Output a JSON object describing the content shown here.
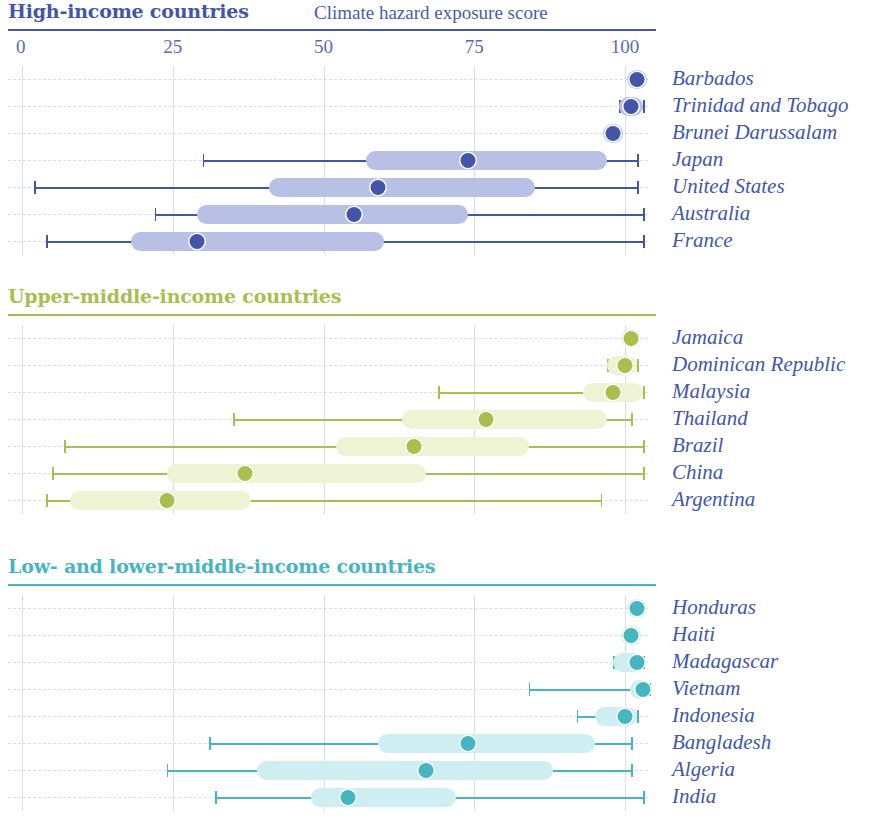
{
  "axis_title": "Climate hazard exposure score",
  "axis": {
    "ticks": [
      "0",
      "25",
      "50",
      "75",
      "100"
    ],
    "min": 0,
    "max": 100
  },
  "panels": [
    {
      "title": "High-income countries",
      "color": "#4355a8",
      "box_color": "#b9c0e6",
      "rows": [
        {
          "label": "Barbados"
        },
        {
          "label": "Trinidad and Tobago"
        },
        {
          "label": "Brunei Darussalam"
        },
        {
          "label": "Japan"
        },
        {
          "label": "United States"
        },
        {
          "label": "Australia"
        },
        {
          "label": "France"
        }
      ]
    },
    {
      "title": "Upper-middle-income countries",
      "color": "#a8bf4e",
      "box_color": "#eef3d4",
      "rows": [
        {
          "label": "Jamaica"
        },
        {
          "label": "Dominican Republic"
        },
        {
          "label": "Malaysia"
        },
        {
          "label": "Thailand"
        },
        {
          "label": "Brazil"
        },
        {
          "label": "China"
        },
        {
          "label": "Argentina"
        }
      ]
    },
    {
      "title": "Low- and lower-middle-income countries",
      "color": "#45b6c0",
      "box_color": "#cfeef2",
      "rows": [
        {
          "label": "Honduras"
        },
        {
          "label": "Haiti"
        },
        {
          "label": "Madagascar"
        },
        {
          "label": "Vietnam"
        },
        {
          "label": "Indonesia"
        },
        {
          "label": "Bangladesh"
        },
        {
          "label": "Algeria"
        },
        {
          "label": "India"
        }
      ]
    }
  ],
  "chart_data": {
    "type": "boxplot",
    "title": "Climate hazard exposure score",
    "xlabel": "Climate hazard exposure score",
    "ylabel": "",
    "xlim": [
      0,
      100
    ],
    "xticks": [
      0,
      25,
      50,
      75,
      100
    ],
    "grid": true,
    "legend": "none",
    "orientation": "horizontal",
    "groups": [
      {
        "name": "High-income countries",
        "color": "#4355a8",
        "box_color": "#b9c0e6",
        "items": [
          {
            "label": "Barbados",
            "min": 102,
            "q1": 102,
            "median": 102,
            "q3": 102,
            "max": 102
          },
          {
            "label": "Trinidad and Tobago",
            "min": 99,
            "q1": 99,
            "median": 101,
            "q3": 103,
            "max": 103
          },
          {
            "label": "Brunei Darussalam",
            "min": 98,
            "q1": 98,
            "median": 98,
            "q3": 98,
            "max": 98
          },
          {
            "label": "Japan",
            "min": 30,
            "q1": 57,
            "median": 74,
            "q3": 97,
            "max": 102
          },
          {
            "label": "United States",
            "min": 2,
            "q1": 41,
            "median": 59,
            "q3": 85,
            "max": 102
          },
          {
            "label": "Australia",
            "min": 22,
            "q1": 29,
            "median": 55,
            "q3": 74,
            "max": 103
          },
          {
            "label": "France",
            "min": 4,
            "q1": 18,
            "median": 29,
            "q3": 60,
            "max": 103
          }
        ]
      },
      {
        "name": "Upper-middle-income countries",
        "color": "#a8bf4e",
        "box_color": "#eef3d4",
        "items": [
          {
            "label": "Jamaica",
            "min": 101,
            "q1": 101,
            "median": 101,
            "q3": 101,
            "max": 101
          },
          {
            "label": "Dominican Republic",
            "min": 97,
            "q1": 97,
            "median": 100,
            "q3": 102,
            "max": 102
          },
          {
            "label": "Malaysia",
            "min": 69,
            "q1": 93,
            "median": 98,
            "q3": 103,
            "max": 103
          },
          {
            "label": "Thailand",
            "min": 35,
            "q1": 63,
            "median": 77,
            "q3": 97,
            "max": 101
          },
          {
            "label": "Brazil",
            "min": 7,
            "q1": 52,
            "median": 65,
            "q3": 84,
            "max": 103
          },
          {
            "label": "China",
            "min": 5,
            "q1": 24,
            "median": 37,
            "q3": 67,
            "max": 103
          },
          {
            "label": "Argentina",
            "min": 4,
            "q1": 8,
            "median": 24,
            "q3": 38,
            "max": 96
          }
        ]
      },
      {
        "name": "Low- and lower-middle-income countries",
        "color": "#45b6c0",
        "box_color": "#cfeef2",
        "items": [
          {
            "label": "Honduras",
            "min": 102,
            "q1": 102,
            "median": 102,
            "q3": 102,
            "max": 102
          },
          {
            "label": "Haiti",
            "min": 101,
            "q1": 101,
            "median": 101,
            "q3": 101,
            "max": 101
          },
          {
            "label": "Madagascar",
            "min": 98,
            "q1": 98,
            "median": 102,
            "q3": 103,
            "max": 103
          },
          {
            "label": "Vietnam",
            "min": 84,
            "q1": 101,
            "median": 103,
            "q3": 104,
            "max": 104
          },
          {
            "label": "Indonesia",
            "min": 92,
            "q1": 95,
            "median": 100,
            "q3": 102,
            "max": 102
          },
          {
            "label": "Bangladesh",
            "min": 31,
            "q1": 59,
            "median": 74,
            "q3": 95,
            "max": 101
          },
          {
            "label": "Algeria",
            "min": 24,
            "q1": 39,
            "median": 67,
            "q3": 88,
            "max": 101
          },
          {
            "label": "India",
            "min": 32,
            "q1": 48,
            "median": 54,
            "q3": 72,
            "max": 103
          }
        ]
      }
    ]
  }
}
